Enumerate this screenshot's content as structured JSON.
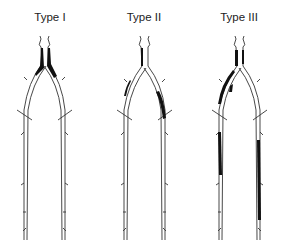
{
  "diagram": {
    "panels": [
      {
        "label": "Type I",
        "description": "Disease confined to distal aorta and common iliac arteries"
      },
      {
        "label": "Type II",
        "description": "Disease extends into external iliac artery"
      },
      {
        "label": "Type III",
        "description": "Multilevel disease including femoropopliteal arteries"
      }
    ],
    "colors": {
      "vessel_outline": "#333333",
      "occlusion": "#111111",
      "background": "#ffffff"
    }
  }
}
